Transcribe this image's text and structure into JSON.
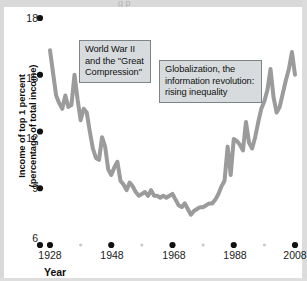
{
  "figure": {
    "top_bleed_ghost_text": "g        p"
  },
  "chart_data": {
    "type": "line",
    "title": "",
    "xlabel": "Year",
    "ylabel": "Income of top 1 percent (percentage of total income)",
    "ylabel_lines": [
      "Income of top 1 percent",
      "(percentage of total income)"
    ],
    "xlim": [
      1928,
      2008
    ],
    "ylim": [
      6,
      18
    ],
    "xticks": [
      1928,
      1948,
      1968,
      1988,
      2008
    ],
    "xtick_labels": [
      "1928",
      "1948",
      "1968",
      "1988",
      "2008"
    ],
    "xminor_ticks": [
      1938,
      1958,
      1978,
      1998
    ],
    "yticks": [
      6,
      9,
      12,
      15,
      18
    ],
    "ytick_labels": [
      "6",
      "9",
      "12",
      "15",
      "18"
    ],
    "grid": false,
    "legend": null,
    "line_color": "#9b9b9b",
    "line_width": 4,
    "tick_marker": "filled-circle",
    "tick_marker_color": "#111111",
    "series": [
      {
        "name": "Income share of top 1 percent",
        "x": [
          1928,
          1929,
          1930,
          1931,
          1932,
          1933,
          1934,
          1935,
          1936,
          1937,
          1938,
          1939,
          1940,
          1941,
          1942,
          1943,
          1944,
          1945,
          1946,
          1947,
          1948,
          1949,
          1950,
          1951,
          1952,
          1953,
          1954,
          1955,
          1956,
          1957,
          1958,
          1959,
          1960,
          1961,
          1962,
          1963,
          1964,
          1965,
          1966,
          1967,
          1968,
          1969,
          1970,
          1971,
          1972,
          1973,
          1974,
          1975,
          1976,
          1977,
          1978,
          1979,
          1980,
          1981,
          1982,
          1983,
          1984,
          1985,
          1986,
          1987,
          1988,
          1989,
          1990,
          1991,
          1992,
          1993,
          1994,
          1995,
          1996,
          1997,
          1998,
          1999,
          2000,
          2001,
          2002,
          2003,
          2004,
          2005,
          2006,
          2007,
          2008
        ],
        "y": [
          16.3,
          15.1,
          13.9,
          13.5,
          13.2,
          13.9,
          13.3,
          13.4,
          15.0,
          13.7,
          12.6,
          13.2,
          13.0,
          12.0,
          11.1,
          10.6,
          10.5,
          11.7,
          11.2,
          10.0,
          9.7,
          10.1,
          10.4,
          9.4,
          9.2,
          8.9,
          9.3,
          9.1,
          8.8,
          8.6,
          8.7,
          8.8,
          8.6,
          8.9,
          8.6,
          8.6,
          8.5,
          8.6,
          8.5,
          8.6,
          8.7,
          8.4,
          8.1,
          8.0,
          8.2,
          7.9,
          7.6,
          7.8,
          7.9,
          8.0,
          8.0,
          8.1,
          8.2,
          8.2,
          8.4,
          8.7,
          9.1,
          9.4,
          11.2,
          9.7,
          11.6,
          11.5,
          11.3,
          11.0,
          12.5,
          11.4,
          11.1,
          11.7,
          12.5,
          13.2,
          13.6,
          14.2,
          15.3,
          13.8,
          13.0,
          13.3,
          14.0,
          14.7,
          15.3,
          16.2,
          15.0
        ],
        "color": "#9b9b9b"
      }
    ],
    "annotations": [
      {
        "id": "ww2",
        "lines": [
          "World War II",
          "and the \"Great",
          "Compression\""
        ],
        "x_px": 75,
        "y_px": 33
      },
      {
        "id": "globalization",
        "lines": [
          "Globalization, the",
          "information revolution:",
          "rising inequality"
        ],
        "x_px": 155,
        "y_px": 53
      }
    ]
  }
}
